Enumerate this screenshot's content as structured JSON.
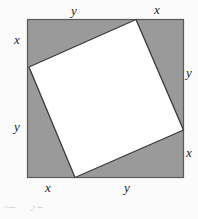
{
  "figure": {
    "name": "inscribed-tilted-square-diagram",
    "background_color": "#fbfbfb",
    "outer_square": {
      "name": "outer-square",
      "fill_color": "#9a9a9a",
      "stroke_color": "#555555",
      "x": 27,
      "y": 19,
      "side": 157
    },
    "inner_square": {
      "name": "inner-tilted-square",
      "fill_color": "#ffffff",
      "stroke_color": "#3a3a3a",
      "vertices": [
        {
          "label": "top-vertex",
          "x": 136,
          "y": 19
        },
        {
          "label": "right-vertex",
          "x": 184,
          "y": 130
        },
        {
          "label": "bottom-vertex",
          "x": 75,
          "y": 178
        },
        {
          "label": "left-vertex",
          "x": 29,
          "y": 67
        }
      ]
    },
    "labels": {
      "top_left_segment": "y",
      "top_right_segment": "x",
      "left_top_segment": "x",
      "left_bottom_segment": "y",
      "right_top_segment": "y",
      "right_bottom_segment": "x",
      "bottom_left_segment": "x",
      "bottom_right_segment": "y"
    },
    "caption_fragment": "x2 + y2"
  }
}
